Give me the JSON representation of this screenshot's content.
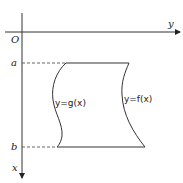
{
  "diagram": {
    "type": "region-between-curves",
    "axes": {
      "horizontal_label": "y",
      "vertical_label": "x",
      "origin_label": "O",
      "vertical_direction": "down"
    },
    "bounds": {
      "lower_label": "a",
      "upper_label": "b"
    },
    "curves": [
      {
        "name": "g",
        "label": "y=g(x)",
        "side": "left"
      },
      {
        "name": "f",
        "label": "y=f(x)",
        "side": "right"
      }
    ],
    "colors": {
      "stroke": "#333333",
      "dashed": "#555555"
    }
  }
}
